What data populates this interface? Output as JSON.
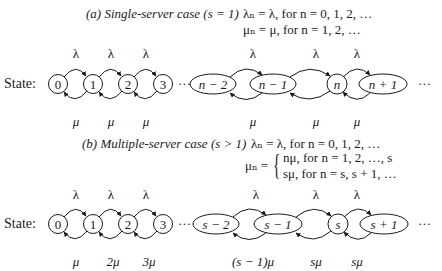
{
  "section_a": {
    "caption_label": "(a)",
    "caption_title": "Single-server case",
    "caption_cond": "(s = 1)",
    "lambda_def": "λₙ = λ,  for n = 0, 1, 2, …",
    "mu_def": "μₙ = μ, for n = 1, 2, …",
    "state_label": "State:",
    "states": [
      "0",
      "1",
      "2",
      "3",
      "n − 2",
      "n − 1",
      "n",
      "n + 1"
    ],
    "ellipsis": "···",
    "arrival_rates": [
      "λ",
      "λ",
      "λ",
      "λ",
      "λ",
      "λ"
    ],
    "service_rates": [
      "μ",
      "μ",
      "μ",
      "μ",
      "μ",
      "μ"
    ]
  },
  "section_b": {
    "caption_label": "(b)",
    "caption_title": "Multiple-server case",
    "caption_cond": "(s > 1)",
    "lambda_def": "λₙ = λ,     for n = 0, 1, 2, …",
    "mu_def_prefix": "μₙ =",
    "mu_def_case1": "nμ,  for n = 1, 2, …, s",
    "mu_def_case2": "sμ,  for n = s, s + 1, …",
    "state_label": "State:",
    "states": [
      "0",
      "1",
      "2",
      "3",
      "s − 2",
      "s − 1",
      "s",
      "s + 1"
    ],
    "ellipsis": "···",
    "arrival_rates": [
      "λ",
      "λ",
      "λ",
      "λ",
      "λ",
      "λ"
    ],
    "service_rates": [
      "μ",
      "2μ",
      "3μ",
      "(s − 1)μ",
      "sμ",
      "sμ"
    ]
  }
}
